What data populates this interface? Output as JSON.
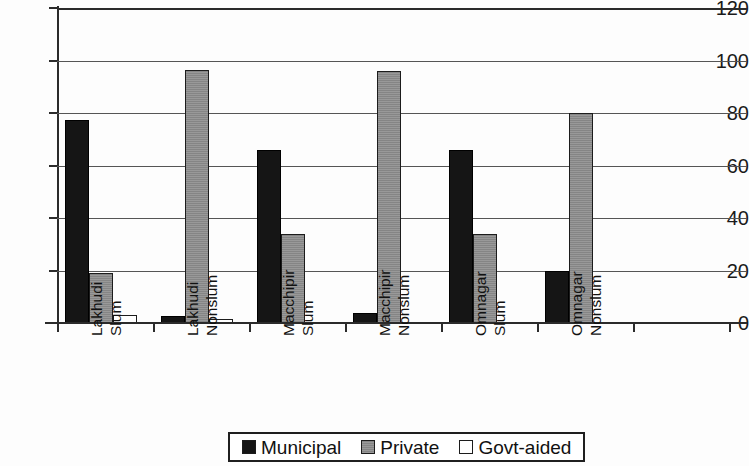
{
  "chart_data": {
    "type": "bar",
    "title": "",
    "xlabel": "",
    "ylabel": "",
    "ylim": [
      0,
      120
    ],
    "yticks": [
      0,
      20,
      40,
      60,
      80,
      100,
      120
    ],
    "grid": true,
    "legend_position": "bottom",
    "categories": [
      "Lakhudi Slum",
      "Lakhudi Nonslum",
      "Macchipir Slum",
      "Macchipir Nonslum",
      "Omnagar Slum",
      "Omnagar Nonslum"
    ],
    "category_lines": [
      [
        "Lakhudi",
        "Slum"
      ],
      [
        "Lakhudi",
        "Nonslum"
      ],
      [
        "Macchipir",
        "Slum"
      ],
      [
        "Macchipir",
        "Nonslum"
      ],
      [
        "Omnagar",
        "Slum"
      ],
      [
        "Omnagar",
        "Nonslum"
      ]
    ],
    "series": [
      {
        "name": "Municipal",
        "color": "#151515",
        "values": [
          77.5,
          2.5,
          66,
          4,
          66,
          20
        ]
      },
      {
        "name": "Private",
        "color": "#8d8d8d",
        "values": [
          19,
          96.5,
          34,
          96,
          34,
          80
        ]
      },
      {
        "name": "Govt-aided",
        "color": "#ffffff",
        "values": [
          3,
          1.5,
          0,
          0,
          0,
          0
        ]
      }
    ]
  },
  "legend": {
    "items": [
      {
        "label": "Municipal",
        "swatch": "municipal"
      },
      {
        "label": "Private",
        "swatch": "private"
      },
      {
        "label": "Govt-aided",
        "swatch": "govt"
      }
    ]
  }
}
